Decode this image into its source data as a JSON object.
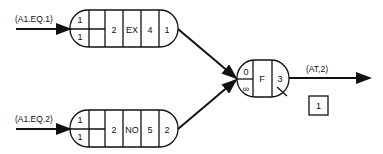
{
  "diagram": {
    "inputs": [
      {
        "label": "(A1.EQ.1)"
      },
      {
        "label": "(A1.EQ.2)"
      }
    ],
    "nodes": [
      {
        "cells": [
          "1",
          "1",
          "2",
          "EX",
          "4",
          "1"
        ]
      },
      {
        "cells": [
          "1",
          "1",
          "2",
          "NO",
          "5",
          "2"
        ]
      }
    ],
    "join": {
      "top": "0",
      "bottom": "∞",
      "op": "F",
      "count": "3"
    },
    "output": {
      "label": "(AT,2)"
    },
    "box": {
      "label": "1"
    }
  }
}
